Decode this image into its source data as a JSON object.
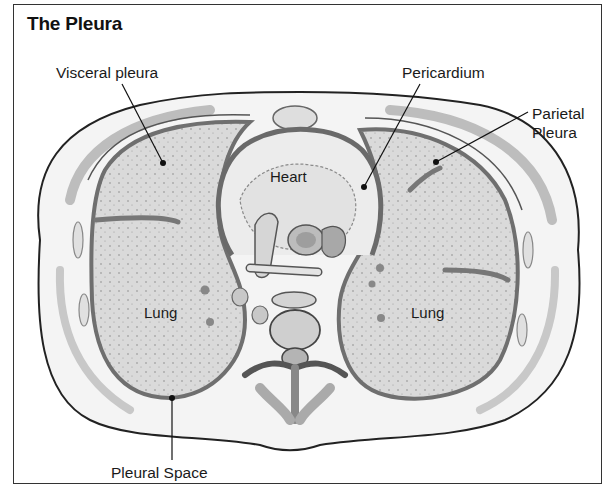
{
  "figure": {
    "title": "The Pleura",
    "labels": {
      "visceral_pleura": "Visceral pleura",
      "pericardium": "Pericardium",
      "parietal_pleura_line1": "Parietal",
      "parietal_pleura_line2": "Pleura",
      "heart": "Heart",
      "lung_left": "Lung",
      "lung_right": "Lung",
      "pleural_space": "Pleural Space"
    },
    "colors": {
      "outline": "#222222",
      "tissue_fill": "#f2f2f2",
      "lung_fill": "#d9d9d9",
      "membrane": "#7a7a7a",
      "muscle": "#bdbdbd"
    }
  }
}
